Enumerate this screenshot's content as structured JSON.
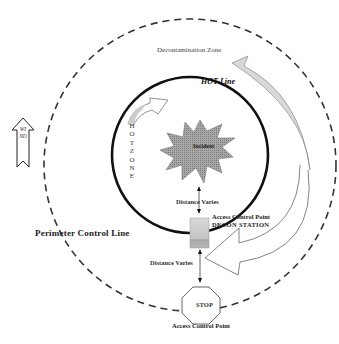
{
  "diagram": {
    "zones": {
      "decontamination_zone": "Decontamination Zone",
      "hot_line": "HOT Line",
      "hot_zone": "HOT ZONE",
      "incident": "Incident",
      "perimeter_control_line": "Perimeter Control Line"
    },
    "annotations": {
      "distance_varies_upper": "Distance Varies",
      "distance_varies_lower": "Distance Varies",
      "access_control_point_decon": "Access Control Point",
      "decon_station": "DECON STATION",
      "stop_sign": "STOP",
      "access_control_point_bottom": "Access Control Point"
    },
    "wind_indicator": {
      "label": "WIND",
      "direction": "up"
    },
    "colors": {
      "line": "#111111",
      "dashed_line": "#333333",
      "incident_fill": "#9a9a9a",
      "decon_station_fill": "#c8c8c8",
      "arrow_fill": "#d9d9d9"
    }
  }
}
